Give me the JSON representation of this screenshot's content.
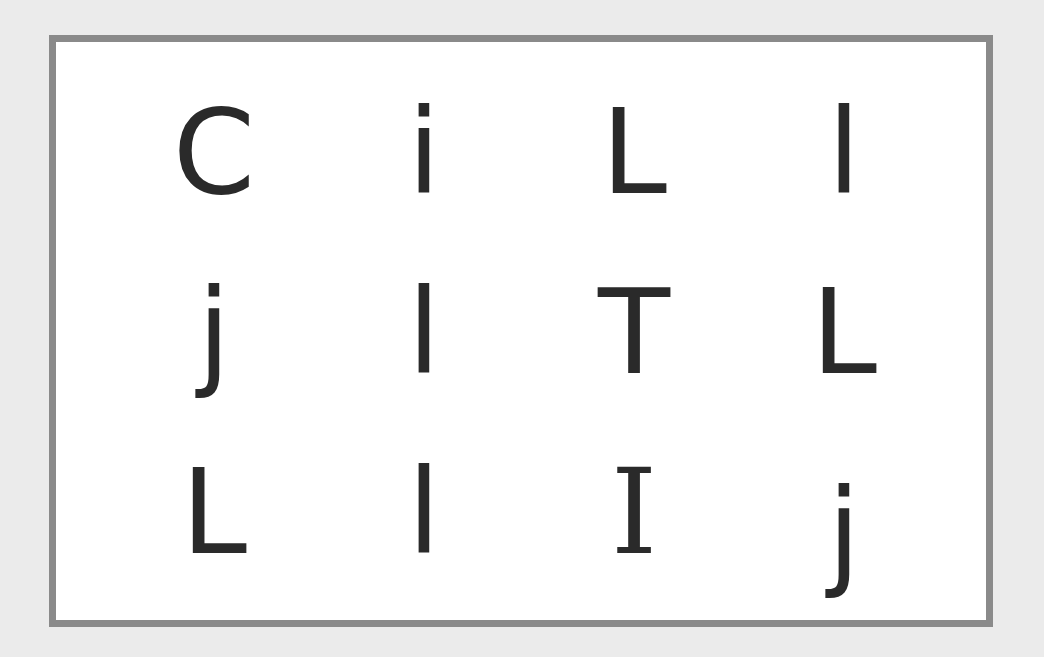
{
  "board": {
    "rows": [
      [
        "C",
        "i",
        "L",
        "l"
      ],
      [
        "j",
        "l",
        "T",
        "L"
      ],
      [
        "L",
        "l",
        "I",
        "j"
      ]
    ],
    "colors": {
      "background": "#ebebeb",
      "board_fill": "#ffffff",
      "border": "#8a8a8a",
      "letter": "#2a2a2a"
    }
  }
}
